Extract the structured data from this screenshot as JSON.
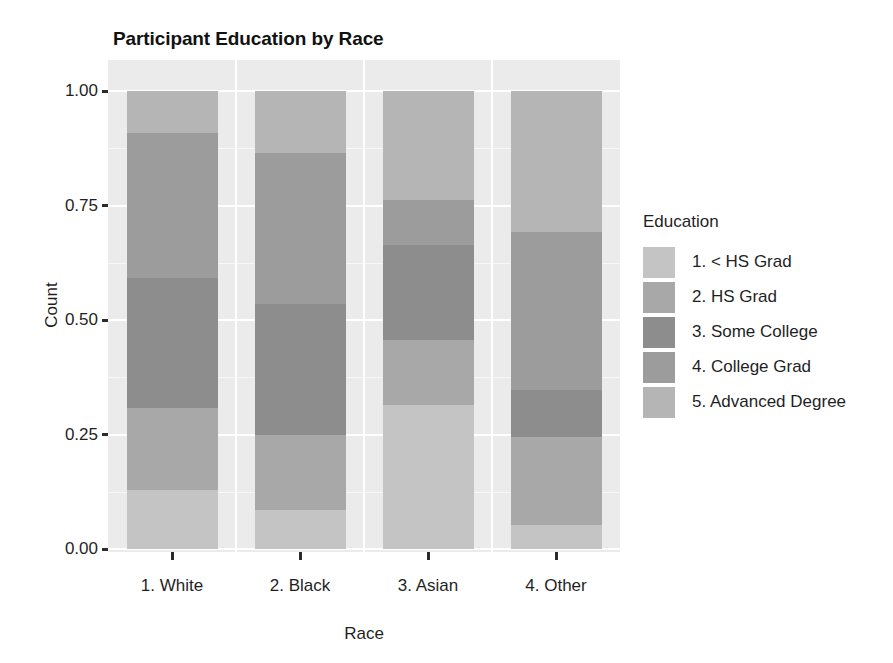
{
  "chart_data": {
    "type": "bar",
    "subtype": "stacked-proportional",
    "title": "Participant Education by Race",
    "xlabel": "Race",
    "ylabel": "Count",
    "categories": [
      "1. White",
      "2. Black",
      "3. Asian",
      "4. Other"
    ],
    "ylim": [
      0.0,
      1.0
    ],
    "ytick_labels": [
      "0.00",
      "0.25",
      "0.50",
      "0.75",
      "1.00"
    ],
    "ytick_values": [
      0.0,
      0.25,
      0.5,
      0.75,
      1.0
    ],
    "grid": true,
    "legend_title": "Education",
    "legend_position": "right",
    "series": [
      {
        "name": "1. < HS Grad",
        "color": "#c4c4c4",
        "values": [
          0.129,
          0.085,
          0.314,
          0.052
        ]
      },
      {
        "name": "2. HS Grad",
        "color": "#a8a8a8",
        "values": [
          0.179,
          0.164,
          0.142,
          0.193
        ]
      },
      {
        "name": "3. Some College",
        "color": "#8d8d8d",
        "values": [
          0.284,
          0.286,
          0.208,
          0.102
        ]
      },
      {
        "name": "4. College Grad",
        "color": "#9c9c9c",
        "values": [
          0.316,
          0.33,
          0.098,
          0.345
        ]
      },
      {
        "name": "5. Advanced Degree",
        "color": "#b5b5b5",
        "values": [
          0.092,
          0.135,
          0.238,
          0.308
        ]
      }
    ]
  },
  "panel": {
    "background_color": "#ebebeb",
    "gridline_color": "#ffffff"
  }
}
